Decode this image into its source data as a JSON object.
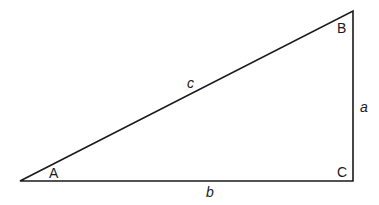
{
  "diagram": {
    "type": "right-triangle",
    "stroke_color": "#1a1a1a",
    "background": "#ffffff",
    "vertices": {
      "A": {
        "label": "A",
        "x": 20,
        "y": 181
      },
      "B": {
        "label": "B",
        "x": 353,
        "y": 11
      },
      "C": {
        "label": "C",
        "x": 353,
        "y": 181
      }
    },
    "sides": {
      "a": {
        "label": "a",
        "between": [
          "B",
          "C"
        ]
      },
      "b": {
        "label": "b",
        "between": [
          "A",
          "C"
        ]
      },
      "c": {
        "label": "c",
        "between": [
          "A",
          "B"
        ]
      }
    },
    "right_angle_at": "C"
  }
}
